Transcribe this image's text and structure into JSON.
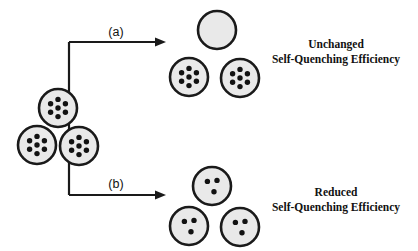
{
  "figure": {
    "background_color": "#ffffff",
    "ink_color": "#1a1a1a",
    "vesicle_fill_color": "#e9e9e9",
    "dot_color": "#121212",
    "width": 418,
    "height": 251
  },
  "branches": {
    "a": {
      "label": "(a)",
      "caption_line1": "Unchanged",
      "caption_line2": "Self-Quenching Efficiency",
      "caption_x": 336,
      "caption_y1": 48,
      "caption_y2": 63,
      "label_x": 116,
      "label_y": 36,
      "arrow_y": 42,
      "arrow_x_start": 69,
      "arrow_x_end": 166
    },
    "b": {
      "label": "(b)",
      "caption_line1": "Reduced",
      "caption_line2": "Self-Quenching Efficiency",
      "caption_x": 336,
      "caption_y1": 196,
      "caption_y2": 211,
      "label_x": 116,
      "label_y": 188,
      "arrow_y": 195,
      "arrow_x_start": 69,
      "arrow_x_end": 166
    }
  },
  "connector": {
    "stem_x": 69,
    "top_y": 42,
    "bottom_y": 195
  },
  "vesicles": {
    "source_cluster": {
      "name": "source-vesicle-cluster",
      "dot_count": 7,
      "radius": 19,
      "items": [
        {
          "name": "source-vesicle-top",
          "cx": 58,
          "cy": 108
        },
        {
          "name": "source-vesicle-left",
          "cx": 37,
          "cy": 145
        },
        {
          "name": "source-vesicle-right",
          "cx": 79,
          "cy": 146
        }
      ]
    },
    "branch_a_cluster": {
      "name": "branch-a-vesicle-cluster",
      "radius": 19,
      "items": [
        {
          "name": "vesicle-a-top-empty",
          "cx": 217,
          "cy": 30,
          "dot_count": 0
        },
        {
          "name": "vesicle-a-left",
          "cx": 189,
          "cy": 77,
          "dot_count": 7
        },
        {
          "name": "vesicle-a-right",
          "cx": 240,
          "cy": 78,
          "dot_count": 7
        }
      ]
    },
    "branch_b_cluster": {
      "name": "branch-b-vesicle-cluster",
      "radius": 19,
      "items": [
        {
          "name": "vesicle-b-top",
          "cx": 212,
          "cy": 186,
          "dot_count": 3
        },
        {
          "name": "vesicle-b-left",
          "cx": 189,
          "cy": 226,
          "dot_count": 3
        },
        {
          "name": "vesicle-b-right",
          "cx": 240,
          "cy": 227,
          "dot_count": 3
        }
      ]
    }
  },
  "dot_layouts": {
    "seven": [
      {
        "dx": 0,
        "dy": 0
      },
      {
        "dx": 0,
        "dy": -8.6
      },
      {
        "dx": 7.4,
        "dy": -4.3
      },
      {
        "dx": 7.4,
        "dy": 4.3
      },
      {
        "dx": 0,
        "dy": 8.6
      },
      {
        "dx": -7.4,
        "dy": 4.3
      },
      {
        "dx": -7.4,
        "dy": -4.3
      }
    ],
    "three": [
      {
        "dx": -4.6,
        "dy": -4.6
      },
      {
        "dx": 5.0,
        "dy": -5.6
      },
      {
        "dx": 2.0,
        "dy": 5.8
      }
    ],
    "dot_radius": 2.7
  }
}
